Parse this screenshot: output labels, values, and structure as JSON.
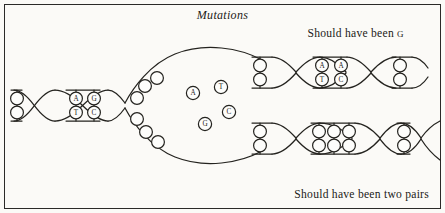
{
  "figure": {
    "title": "Mutations",
    "annotations": {
      "top_right": "Should have been",
      "top_right_base": "g",
      "bottom_right": "Should have been two pairs"
    },
    "ink_color": "#24231f",
    "paper_color": "#fbfaf7",
    "border_color": "#2b2a28"
  },
  "parent_helix": {
    "blank_pair_left": [
      "",
      ""
    ],
    "labeled_pairs": [
      {
        "top": "A",
        "bottom": "T"
      },
      {
        "top": "G",
        "bottom": "C"
      }
    ]
  },
  "replication_bubble": {
    "free_bases": [
      {
        "label": "A",
        "x": 193,
        "y": 93
      },
      {
        "label": "T",
        "x": 221,
        "y": 87
      },
      {
        "label": "C",
        "x": 229,
        "y": 112
      },
      {
        "label": "G",
        "x": 205,
        "y": 124
      }
    ],
    "unpaired_upper_strand": 3,
    "unpaired_lower_strand": 3
  },
  "daughter_top": {
    "blank_pairs_first_segment": 2,
    "labeled_pairs": [
      {
        "top": "A",
        "bottom": "T"
      },
      {
        "top": "A",
        "bottom": "C"
      }
    ],
    "blank_pairs_last_segment": 2,
    "mutation_note": "Should have been g"
  },
  "daughter_bottom": {
    "blank_pairs_first_segment": 2,
    "blank_pairs_middle_segment": 3,
    "blank_pairs_last_segment": 2,
    "mutation_note": "Should have been two pairs"
  }
}
